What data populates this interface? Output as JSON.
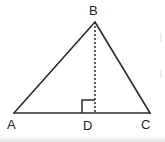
{
  "figure": {
    "kind": "geometry-diagram",
    "shape": "triangle",
    "background_color": "#ffffff",
    "stroke_color": "#2b2b30",
    "label_color": "#232328",
    "canvas": {
      "width": 165,
      "height": 142
    },
    "labels": {
      "apex": "B",
      "left_base": "A",
      "foot_of_altitude": "D",
      "right_base": "C"
    },
    "points": {
      "A": {
        "x": 14,
        "y": 113
      },
      "B": {
        "x": 95,
        "y": 22
      },
      "C": {
        "x": 150,
        "y": 113
      },
      "D": {
        "x": 95,
        "y": 113
      }
    },
    "segments": [
      {
        "name": "AB",
        "from": "A",
        "to": "B",
        "style": "solid",
        "width": 1.6
      },
      {
        "name": "BC",
        "from": "B",
        "to": "C",
        "style": "solid",
        "width": 1.6
      },
      {
        "name": "AC",
        "from": "A",
        "to": "C",
        "style": "solid",
        "width": 1.6
      },
      {
        "name": "BD",
        "from": "B",
        "to": "D",
        "style": "dashed",
        "width": 1.5,
        "dash_pattern": "2 2"
      }
    ],
    "right_angle_marker": {
      "at_point": "D",
      "side": "left",
      "size": 13,
      "x": 82,
      "y": 100
    }
  }
}
